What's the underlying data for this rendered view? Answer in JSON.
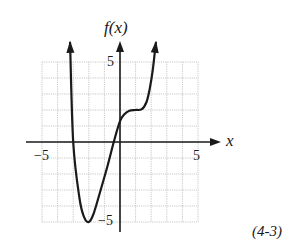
{
  "figure": {
    "y_axis_label": "f(x)",
    "x_axis_label": "x",
    "tag": "(4-3)",
    "ticks": {
      "x_min_label": "−5",
      "x_max_label": "5",
      "y_max_label": "5",
      "y_min_label": "−5"
    }
  },
  "chart_data": {
    "type": "line",
    "title": "",
    "xlabel": "x",
    "ylabel": "f(x)",
    "xlim": [
      -5,
      5
    ],
    "ylim": [
      -5,
      5
    ],
    "grid": true,
    "grid_step": 1,
    "legend": null,
    "annotation": "(4-3)",
    "series": [
      {
        "name": "f(x)",
        "x": [
          -3.2,
          -3.0,
          -2.6,
          -2.3,
          -2.0,
          -1.7,
          -1.3,
          -0.8,
          -0.4,
          0.0,
          0.3,
          0.6,
          1.0,
          1.4,
          1.7,
          1.9,
          2.1,
          2.3
        ],
        "y": [
          6.2,
          0.0,
          -3.5,
          -4.7,
          -5.0,
          -4.5,
          -3.2,
          -1.5,
          0.0,
          1.3,
          1.75,
          1.95,
          2.0,
          2.05,
          2.5,
          3.3,
          4.5,
          6.2
        ],
        "arrows": "both ends continue upward"
      }
    ],
    "key_points": {
      "minimum": [
        -2,
        -5
      ],
      "x_intercepts": [
        -3,
        -0.4
      ],
      "y_intercept": 1.3,
      "plateau": [
        1,
        2
      ]
    }
  }
}
